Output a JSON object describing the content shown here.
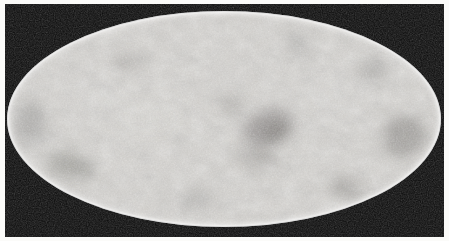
{
  "figure": {
    "kind": "all-sky-map",
    "projection": "Mollweide",
    "rendering": "grayscale halftone scan",
    "title": "",
    "caption": "",
    "has_axes": false,
    "has_gridlines": false,
    "has_legend": false,
    "has_colorbar": false,
    "has_text_labels": false
  },
  "canvas": {
    "width": 449,
    "height": 241,
    "paper_color": "#fbfbf9",
    "margin_px": 4
  },
  "plate": {
    "x": 5,
    "y": 4,
    "width": 439,
    "height": 233,
    "background_color": "#080808"
  },
  "map": {
    "center_x": 224,
    "center_y": 119,
    "semi_axis_x": 216,
    "semi_axis_y": 107,
    "base_color": "#cccac6",
    "bright_color": "#ededea",
    "dark_color": "#6e6c69",
    "rim_highlight_color": "#ffffff"
  },
  "chart_data": {
    "type": "heatmap",
    "title": "",
    "subtitle": "",
    "xlabel": "",
    "ylabel": "",
    "projection": "Mollweide",
    "colormap": "grayscale",
    "legend": [],
    "tick_labels": {
      "x": [],
      "y": []
    },
    "grid": false,
    "xlim": [
      -180,
      180
    ],
    "ylim": [
      -90,
      90
    ],
    "background": "#080808",
    "texture": {
      "kind": "fine-mottled-noise",
      "base_level": 0.8,
      "noise_amplitude": 0.16,
      "grain_scale_px": 2.0
    },
    "features": [
      {
        "name": "central-dark-cluster",
        "cx": 268,
        "cy": 128,
        "rx": 26,
        "ry": 17,
        "intensity": -0.3,
        "rot": -18
      },
      {
        "name": "central-dark-core",
        "cx": 277,
        "cy": 133,
        "rx": 12,
        "ry": 8,
        "intensity": -0.36,
        "rot": -12
      },
      {
        "name": "upper-center-dark-spot",
        "cx": 232,
        "cy": 105,
        "rx": 11,
        "ry": 7,
        "intensity": -0.22,
        "rot": 20
      },
      {
        "name": "below-center-dark-arc",
        "cx": 258,
        "cy": 158,
        "rx": 20,
        "ry": 10,
        "intensity": -0.2,
        "rot": 12
      },
      {
        "name": "lower-left-dark-patch",
        "cx": 70,
        "cy": 166,
        "rx": 24,
        "ry": 12,
        "intensity": -0.24,
        "rot": 16
      },
      {
        "name": "left-limb-dark-band",
        "cx": 30,
        "cy": 124,
        "rx": 16,
        "ry": 22,
        "intensity": -0.18,
        "rot": 0
      },
      {
        "name": "right-limb-dark-band",
        "cx": 404,
        "cy": 136,
        "rx": 22,
        "ry": 20,
        "intensity": -0.26,
        "rot": -25
      },
      {
        "name": "right-upper-dark-spot",
        "cx": 372,
        "cy": 70,
        "rx": 16,
        "ry": 9,
        "intensity": -0.18,
        "rot": -30
      },
      {
        "name": "lower-right-dark-spot",
        "cx": 346,
        "cy": 188,
        "rx": 18,
        "ry": 9,
        "intensity": -0.22,
        "rot": 22
      },
      {
        "name": "upper-left-dark-spot",
        "cx": 126,
        "cy": 62,
        "rx": 15,
        "ry": 8,
        "intensity": -0.16,
        "rot": -14
      },
      {
        "name": "top-center-dark-spot",
        "cx": 300,
        "cy": 44,
        "rx": 14,
        "ry": 7,
        "intensity": -0.18,
        "rot": 28
      },
      {
        "name": "bottom-center-dark-spot",
        "cx": 196,
        "cy": 200,
        "rx": 17,
        "ry": 8,
        "intensity": -0.17,
        "rot": -8
      },
      {
        "name": "mid-left-bright-region",
        "cx": 150,
        "cy": 118,
        "rx": 34,
        "ry": 22,
        "intensity": 0.1,
        "rot": 0
      },
      {
        "name": "upper-right-bright",
        "cx": 330,
        "cy": 96,
        "rx": 30,
        "ry": 18,
        "intensity": 0.09,
        "rot": 0
      },
      {
        "name": "left-bright-region",
        "cx": 96,
        "cy": 96,
        "rx": 28,
        "ry": 18,
        "intensity": 0.08,
        "rot": 0
      }
    ]
  }
}
